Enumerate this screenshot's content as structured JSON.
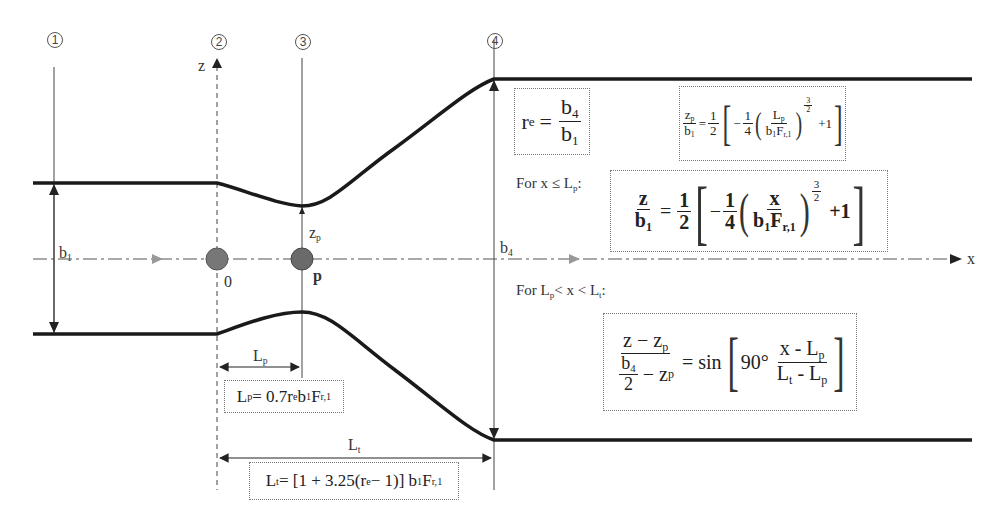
{
  "sections": [
    {
      "id": "1",
      "label": "①",
      "x": 54
    },
    {
      "id": "2",
      "label": "②",
      "x": 217
    },
    {
      "id": "3",
      "label": "③",
      "x": 302
    },
    {
      "id": "4",
      "label": "④",
      "x": 494
    }
  ],
  "axes": {
    "z_label": "z",
    "x_label": "x"
  },
  "points": {
    "origin_label": "0",
    "p_label": "p"
  },
  "dimensions": {
    "b1": {
      "base": "b",
      "sub": "1"
    },
    "b4": {
      "base": "b",
      "sub": "4"
    },
    "zp": {
      "base": "z",
      "sub": "p"
    },
    "Lp": {
      "base": "L",
      "sub": "p"
    },
    "Lt": {
      "base": "L",
      "sub": "t"
    }
  },
  "equations": {
    "re": {
      "lhs_base": "r",
      "lhs_sub": "e",
      "eq": "=",
      "num_base": "b",
      "num_sub": "4",
      "den_base": "b",
      "den_sub": "1"
    },
    "zp_over_b1": {
      "lhs_num_base": "z",
      "lhs_num_sub": "p",
      "lhs_den_base": "b",
      "lhs_den_sub": "1",
      "eq": "=",
      "half_num": "1",
      "half_den": "2",
      "minus": "−",
      "quarter_num": "1",
      "quarter_den": "4",
      "inner_num_base": "L",
      "inner_num_sub": "p",
      "inner_den": "b",
      "inner_den_sub1": "1",
      "inner_den_F": "F",
      "inner_den_sub2": "r,1",
      "exp_num": "3",
      "exp_den": "2",
      "plus_one": "+1"
    },
    "cond1_label": {
      "prefix": "For x ≤ L",
      "sub": "p",
      "suffix": ":"
    },
    "z_over_b1": {
      "lhs_num": "z",
      "lhs_den_base": "b",
      "lhs_den_sub": "1",
      "eq": "=",
      "half_num": "1",
      "half_den": "2",
      "minus": "−",
      "quarter_num": "1",
      "quarter_den": "4",
      "inner_num": "x",
      "inner_den": "b",
      "inner_den_sub1": "1",
      "inner_den_F": "F",
      "inner_den_sub2": "r,1",
      "exp_num": "3",
      "exp_den": "2",
      "plus_one": "+1"
    },
    "cond2_label": {
      "p1": "For L",
      "s1": "p",
      "p2": "< x < L",
      "s2": "t",
      "p3": ":"
    },
    "sin_eq": {
      "lhs_num": "z − z",
      "lhs_num_sub": "p",
      "lhs_den_b": "b",
      "lhs_den_b_sub": "4",
      "lhs_den_two": "2",
      "lhs_den_minus": "− z",
      "lhs_den_sub": "p",
      "eq": "= sin",
      "deg": "90°",
      "rhs_num": "x - L",
      "rhs_num_sub": "p",
      "rhs_den_a": "L",
      "rhs_den_a_sub": "t",
      "rhs_den_mid": " - L",
      "rhs_den_b_sub": "p"
    },
    "Lp_eq": {
      "lhs": "L",
      "lhs_sub": "p",
      "rhs": " = 0.7r",
      "rhs_sub1": "e",
      "rhs2": "b",
      "rhs_sub2": "1",
      "rhs3": "F",
      "rhs_sub3": "r,1"
    },
    "Lt_eq": {
      "lhs": "L",
      "lhs_sub": "t",
      "rhs": " = [1 + 3.25(r",
      "rhs_sub1": "e",
      "rhs2": " − 1)] b",
      "rhs_sub2": "1",
      "rhs3": "F",
      "rhs_sub3": "r,1"
    }
  },
  "colors": {
    "wall": "#1a1a1a",
    "thin_line": "#444444",
    "centerline": "#555555",
    "flow_arrow": "#888888",
    "point_fill": "#777777",
    "box_border": "#777777"
  }
}
